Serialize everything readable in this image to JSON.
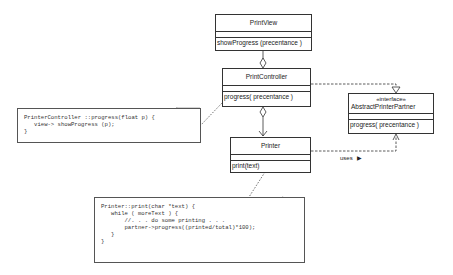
{
  "classes": {
    "print_view": {
      "name": "PrintView",
      "operations": [
        "showProgress (precentance )"
      ]
    },
    "print_controller": {
      "name": "PrintController",
      "operations": [
        "progress( precentance )"
      ]
    },
    "printer": {
      "name": "Printer",
      "operations": [
        "print(text)"
      ]
    },
    "abstract_printer_partner": {
      "stereotype": "«interface»",
      "name": "AbstractPrinterPartner",
      "operations": [
        "progress( precentance )"
      ]
    }
  },
  "notes": {
    "controller_note": "PrinterController ::progress(float p) {\n   view-> showProgress (p);\n}",
    "printer_note": "Printer::print(char *text) {\n   while ( moreText ) {\n       //. . . do some printing . . .\n       partner->progress((printed/total)*100);\n   }\n}"
  },
  "relations": {
    "uses_label": "uses",
    "uses_arrow": "▶"
  },
  "colors": {
    "line": "#333333",
    "note_fold": "#888888",
    "background": "#ffffff"
  }
}
